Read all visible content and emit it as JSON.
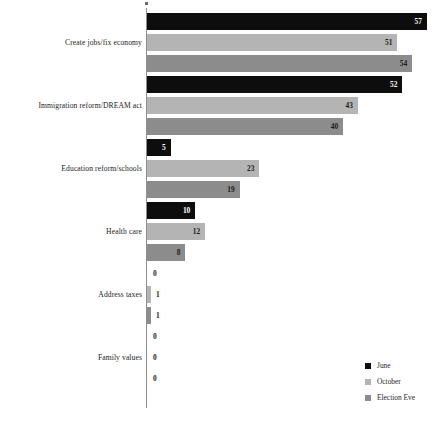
{
  "chart_data": {
    "type": "bar",
    "orientation": "horizontal",
    "title": "",
    "subtitle": "",
    "xlabel": "",
    "ylabel": "",
    "grid": false,
    "xlim": [
      0,
      57
    ],
    "legend_position": "bottom-right",
    "categories": [
      "Create jobs/fix economy",
      "Immigration reform/DREAM act",
      "Education reform/schools",
      "Health care",
      "Address taxes",
      "Family values"
    ],
    "series": [
      {
        "name": "June",
        "color": "#0d0d0d",
        "values": [
          57,
          52,
          5,
          10,
          0,
          0
        ]
      },
      {
        "name": "October",
        "color": "#b4b4b4",
        "values": [
          51,
          43,
          23,
          12,
          1,
          0
        ]
      },
      {
        "name": "Election Eve",
        "color": "#8c8c8c",
        "values": [
          54,
          40,
          19,
          8,
          1,
          0
        ]
      }
    ]
  },
  "legend": {
    "items": [
      {
        "label": "June"
      },
      {
        "label": "October"
      },
      {
        "label": "Election Eve"
      }
    ]
  }
}
